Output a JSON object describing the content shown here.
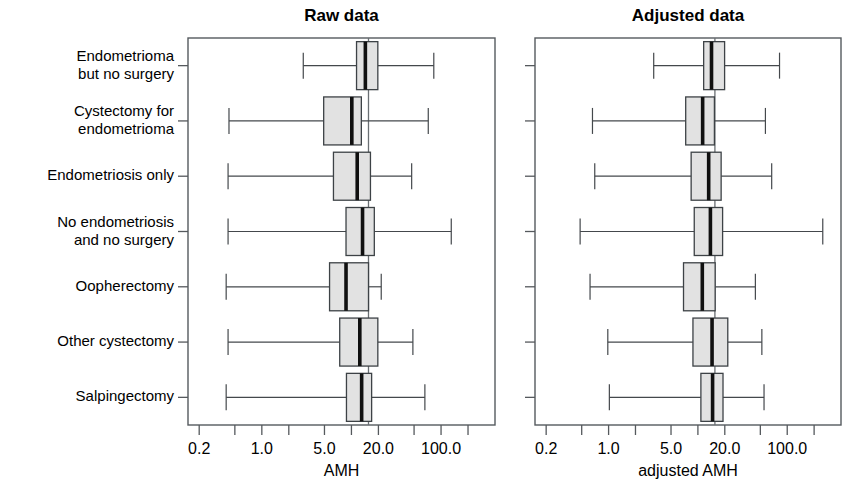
{
  "figure": {
    "panels": [
      {
        "id": "raw",
        "title": "Raw data",
        "xlabel": "AMH"
      },
      {
        "id": "adjusted",
        "title": "Adjusted data",
        "xlabel": "adjusted AMH"
      }
    ],
    "categories": [
      "Endometrioma but no surgery",
      "Cystectomy for endometrioma",
      "Endometriosis only",
      "No endometriosis and no surgery",
      "Oopherectomy",
      "Other cystectomy",
      "Salpingectomy"
    ],
    "category_lines": [
      [
        "Endometrioma",
        "but no surgery"
      ],
      [
        "Cystectomy for",
        "endometrioma"
      ],
      [
        "Endometriosis only"
      ],
      [
        "No endometriosis",
        "and no surgery"
      ],
      [
        "Oopherectomy"
      ],
      [
        "Other cystectomy"
      ],
      [
        "Salpingectomy"
      ]
    ],
    "xticks": [
      "0.2",
      "1.0",
      "5.0",
      "20.0",
      "100.0"
    ],
    "colors": {
      "box_fill": "#e2e2e2",
      "box_stroke": "#3d4246",
      "median": "#101010",
      "frame": "#555a5e",
      "reference_line": "#6a6f73"
    }
  },
  "chart_data": {
    "type": "box",
    "xlabel": "AMH",
    "ylabel": "",
    "xscale": "log",
    "xlim": [
      0.15,
      400
    ],
    "grid": false,
    "legend": null,
    "xtick_values": [
      0.2,
      1.0,
      5.0,
      20.0,
      100.0
    ],
    "xtick_labels": [
      "0.2",
      "1.0",
      "5.0",
      "20.0",
      "100.0"
    ],
    "categories": [
      "Endometrioma but no surgery",
      "Cystectomy for endometrioma",
      "Endometriosis only",
      "No endometriosis and no surgery",
      "Oopherectomy",
      "Other cystectomy",
      "Salpingectomy"
    ],
    "panels": [
      {
        "name": "Raw data",
        "xlabel": "AMH",
        "reference_line": 15.5,
        "boxes": [
          {
            "category": "Endometrioma but no surgery",
            "whisker_low": 2.9,
            "q1": 11.4,
            "median": 14.3,
            "q3": 19.7,
            "whisker_high": 83.0
          },
          {
            "category": "Cystectomy for endometrioma",
            "whisker_low": 0.43,
            "q1": 4.9,
            "median": 10.1,
            "q3": 12.9,
            "whisker_high": 72.0
          },
          {
            "category": "Endometriosis only",
            "whisker_low": 0.42,
            "q1": 6.3,
            "median": 11.6,
            "q3": 16.3,
            "whisker_high": 47.0
          },
          {
            "category": "No endometriosis and no surgery",
            "whisker_low": 0.42,
            "q1": 8.7,
            "median": 13.3,
            "q3": 18.0,
            "whisker_high": 130.0
          },
          {
            "category": "Oopherectomy",
            "whisker_low": 0.4,
            "q1": 5.7,
            "median": 8.7,
            "q3": 15.5,
            "whisker_high": 21.5
          },
          {
            "category": "Other cystectomy",
            "whisker_low": 0.42,
            "q1": 7.4,
            "median": 12.4,
            "q3": 19.7,
            "whisker_high": 48.5
          },
          {
            "category": "Salpingectomy",
            "whisker_low": 0.4,
            "q1": 8.8,
            "median": 13.0,
            "q3": 16.8,
            "whisker_high": 66.0
          }
        ]
      },
      {
        "name": "Adjusted data",
        "xlabel": "adjusted AMH",
        "reference_line": 15.5,
        "boxes": [
          {
            "category": "Endometrioma but no surgery",
            "whisker_low": 3.2,
            "q1": 11.6,
            "median": 14.2,
            "q3": 19.9,
            "whisker_high": 82.0
          },
          {
            "category": "Cystectomy for endometrioma",
            "whisker_low": 0.66,
            "q1": 7.3,
            "median": 11.3,
            "q3": 15.3,
            "whisker_high": 57.0
          },
          {
            "category": "Endometriosis only",
            "whisker_low": 0.7,
            "q1": 8.4,
            "median": 13.2,
            "q3": 18.2,
            "whisker_high": 67.0
          },
          {
            "category": "No endometriosis and no surgery",
            "whisker_low": 0.48,
            "q1": 9.1,
            "median": 13.8,
            "q3": 18.9,
            "whisker_high": 250.0
          },
          {
            "category": "Oopherectomy",
            "whisker_low": 0.62,
            "q1": 6.9,
            "median": 11.2,
            "q3": 15.6,
            "whisker_high": 44.0
          },
          {
            "category": "Other cystectomy",
            "whisker_low": 0.98,
            "q1": 8.8,
            "median": 14.4,
            "q3": 21.6,
            "whisker_high": 52.0
          },
          {
            "category": "Salpingectomy",
            "whisker_low": 1.02,
            "q1": 10.8,
            "median": 14.6,
            "q3": 19.1,
            "whisker_high": 55.0
          }
        ]
      }
    ]
  }
}
